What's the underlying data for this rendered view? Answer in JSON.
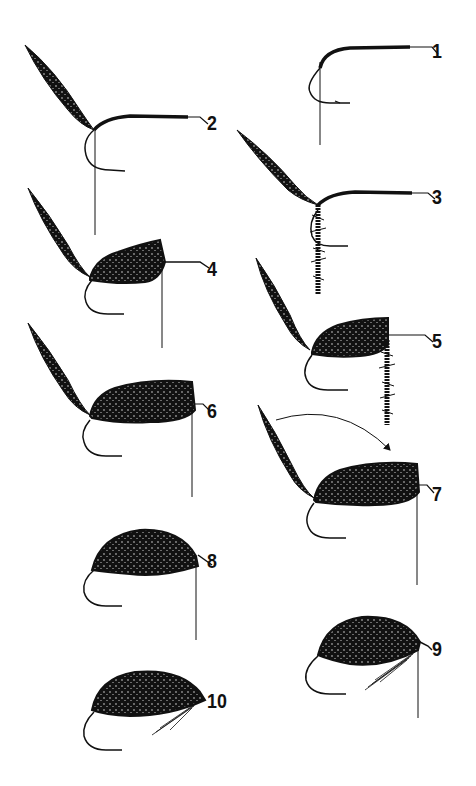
{
  "figure": {
    "type": "step-by-step illustration",
    "ink_color": "#111111",
    "background_color": "#ffffff",
    "steps": [
      {
        "label": "1",
        "x": 432,
        "y": 40
      },
      {
        "label": "2",
        "x": 207,
        "y": 112
      },
      {
        "label": "3",
        "x": 432,
        "y": 186
      },
      {
        "label": "4",
        "x": 207,
        "y": 258
      },
      {
        "label": "5",
        "x": 432,
        "y": 330
      },
      {
        "label": "6",
        "x": 207,
        "y": 400
      },
      {
        "label": "7",
        "x": 432,
        "y": 483
      },
      {
        "label": "8",
        "x": 207,
        "y": 550
      },
      {
        "label": "9",
        "x": 432,
        "y": 638
      },
      {
        "label": "10",
        "x": 207,
        "y": 690
      }
    ]
  }
}
